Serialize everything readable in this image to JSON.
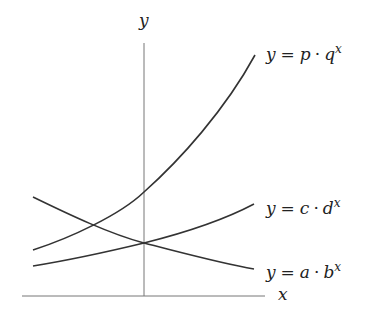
{
  "diagram": {
    "axes": {
      "x_label": "x",
      "y_label": "y"
    },
    "curves": [
      {
        "id": "pq",
        "label_lhs": "y",
        "label_eq": "=",
        "label_base": "p",
        "label_dot": "·",
        "label_var": "q",
        "label_exp": "x",
        "behavior": "increasing (steep)"
      },
      {
        "id": "cd",
        "label_lhs": "y",
        "label_eq": "=",
        "label_base": "c",
        "label_dot": "·",
        "label_var": "d",
        "label_exp": "x",
        "behavior": "increasing (gentle)"
      },
      {
        "id": "ab",
        "label_lhs": "y",
        "label_eq": "=",
        "label_base": "a",
        "label_dot": "·",
        "label_var": "b",
        "label_exp": "x",
        "behavior": "decreasing"
      }
    ],
    "colors": {
      "curve": "#333333",
      "axis": "#777777",
      "text": "#222222"
    }
  }
}
